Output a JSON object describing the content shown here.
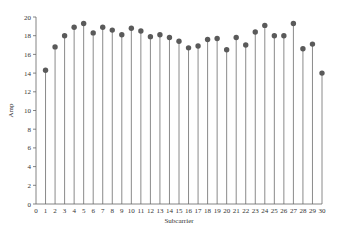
{
  "chart_data": {
    "type": "stem",
    "title": "",
    "xlabel": "Subcarrier",
    "ylabel": "Amp",
    "xlim": [
      0,
      30
    ],
    "ylim": [
      0,
      20
    ],
    "xticks": [
      "0",
      "1",
      "2",
      "3",
      "4",
      "5",
      "6",
      "7",
      "8",
      "9",
      "10",
      "11",
      "12",
      "13",
      "14",
      "15",
      "16",
      "17",
      "18",
      "19",
      "20",
      "21",
      "22",
      "23",
      "24",
      "25",
      "26",
      "27",
      "28",
      "29",
      "30"
    ],
    "yticks": [
      "0",
      "2",
      "4",
      "6",
      "8",
      "10",
      "12",
      "14",
      "16",
      "18",
      "20"
    ],
    "grid": false,
    "legend": null,
    "x": [
      1,
      2,
      3,
      4,
      5,
      6,
      7,
      8,
      9,
      10,
      11,
      12,
      13,
      14,
      15,
      16,
      17,
      18,
      19,
      20,
      21,
      22,
      23,
      24,
      25,
      26,
      27,
      28,
      29,
      30
    ],
    "values": [
      14.3,
      16.8,
      18.0,
      18.9,
      19.3,
      18.3,
      18.9,
      18.6,
      18.1,
      18.8,
      18.5,
      17.9,
      18.1,
      17.8,
      17.4,
      16.7,
      16.9,
      17.6,
      17.7,
      16.5,
      17.8,
      17.0,
      18.4,
      19.1,
      18.0,
      18.0,
      19.3,
      16.6,
      17.1,
      14.0
    ],
    "colors": {
      "stem": "#8a8a8a",
      "marker": "#5a5a5a",
      "axis": "#666666"
    }
  }
}
